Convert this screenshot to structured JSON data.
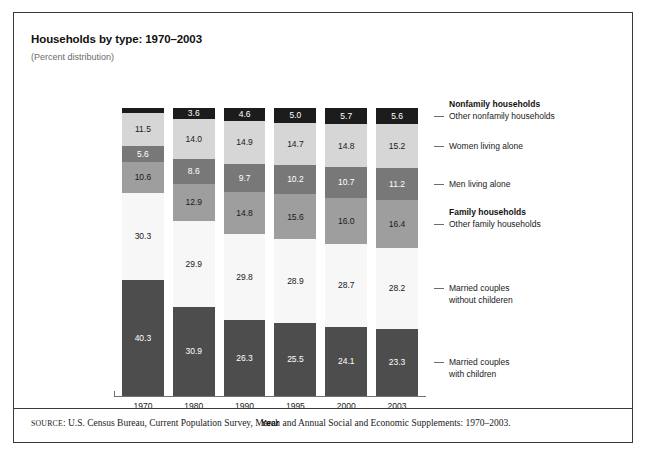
{
  "header": {
    "title": "Households by type: 1970–2003",
    "subtitle": "(Percent distribution)"
  },
  "axis": {
    "x_title": "Year"
  },
  "legend": {
    "group_nonfamily": "Nonfamily households",
    "group_family": "Family households",
    "entries": [
      {
        "label_line1": "Other nonfamily households",
        "label_line2": ""
      },
      {
        "label_line1": "Women living alone",
        "label_line2": ""
      },
      {
        "label_line1": "Men living alone",
        "label_line2": ""
      },
      {
        "label_line1": "Other family households",
        "label_line2": ""
      },
      {
        "label_line1": "Married couples",
        "label_line2": "without childeren"
      },
      {
        "label_line1": "Married couples",
        "label_line2": "with children"
      }
    ]
  },
  "source": {
    "prefix": "SOURCE",
    "text": ": U.S. Census Bureau, Current Population Survey, March and Annual Social and Economic Supplements: 1970–2003."
  },
  "colors": {
    "other_nonfamily": "#1c1c1c",
    "women_alone": "#d6d6d6",
    "men_alone": "#787878",
    "other_family": "#9e9e9e",
    "married_without": "#f7f7f7",
    "married_with": "#4d4d4d",
    "frame": "#3a3a3a",
    "axis": "#707070"
  },
  "chart_data": {
    "type": "bar",
    "subtype": "stacked-100-percent-vertical",
    "title": "Households by type: 1970–2003",
    "subtitle": "(Percent distribution)",
    "xlabel": "Year",
    "ylabel": "",
    "ylim": [
      0,
      100
    ],
    "grid": false,
    "legend_position": "right",
    "categories": [
      "1970",
      "1980",
      "1990",
      "1995",
      "2000",
      "2003"
    ],
    "series": [
      {
        "name": "Married couples with children",
        "group": "Family households",
        "color": "#4d4d4d",
        "text_color": "#ffffff",
        "values": [
          40.3,
          30.9,
          26.3,
          25.5,
          24.1,
          23.3
        ]
      },
      {
        "name": "Married couples without childeren",
        "group": "Family households",
        "color": "#f7f7f7",
        "text_color": "#1a1a1a",
        "values": [
          30.3,
          29.9,
          29.8,
          28.9,
          28.7,
          28.2
        ]
      },
      {
        "name": "Other family households",
        "group": "Family households",
        "color": "#9e9e9e",
        "text_color": "#1a1a1a",
        "values": [
          10.6,
          12.9,
          14.8,
          15.6,
          16.0,
          16.4
        ]
      },
      {
        "name": "Men living alone",
        "group": "Nonfamily households",
        "color": "#787878",
        "text_color": "#ffffff",
        "values": [
          5.6,
          8.6,
          9.7,
          10.2,
          10.7,
          11.2
        ]
      },
      {
        "name": "Women living alone",
        "group": "Nonfamily households",
        "color": "#d6d6d6",
        "text_color": "#1a1a1a",
        "values": [
          11.5,
          14.0,
          14.9,
          14.7,
          14.8,
          15.2
        ]
      },
      {
        "name": "Other nonfamily households",
        "group": "Nonfamily households",
        "color": "#1c1c1c",
        "text_color": "#ffffff",
        "values": [
          1.7,
          3.6,
          4.6,
          5.0,
          5.7,
          5.6
        ],
        "label_outside": [
          true,
          false,
          false,
          false,
          false,
          false
        ]
      }
    ]
  }
}
